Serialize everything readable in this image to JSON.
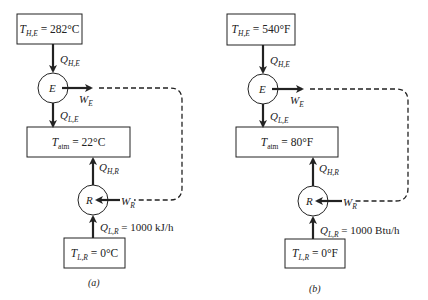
{
  "panels": [
    {
      "caption": "(a)",
      "hot_reservoir": {
        "symbol": "T",
        "sub": "H,E",
        "value": "= 282°C"
      },
      "engine": {
        "label": "E"
      },
      "q_h_e": {
        "symbol": "Q",
        "sub": "H,E"
      },
      "w_e": {
        "symbol": "W",
        "sub": "E"
      },
      "q_l_e": {
        "symbol": "Q",
        "sub": "L,E"
      },
      "atmosphere": {
        "symbol": "T",
        "sub": "atm",
        "value": "= 22°C"
      },
      "q_h_r": {
        "symbol": "Q",
        "sub": "H,R"
      },
      "refrigerator": {
        "label": "R"
      },
      "w_r": {
        "symbol": "W",
        "sub": "R"
      },
      "q_l_r": {
        "symbol": "Q",
        "sub": "L,R",
        "value": "= 1000 kJ/h"
      },
      "cold_reservoir": {
        "symbol": "T",
        "sub": "L,R",
        "value": "= 0°C"
      }
    },
    {
      "caption": "(b)",
      "hot_reservoir": {
        "symbol": "T",
        "sub": "H,E",
        "value": "= 540°F"
      },
      "engine": {
        "label": "E"
      },
      "q_h_e": {
        "symbol": "Q",
        "sub": "H,E"
      },
      "w_e": {
        "symbol": "W",
        "sub": "E"
      },
      "q_l_e": {
        "symbol": "Q",
        "sub": "L,E"
      },
      "atmosphere": {
        "symbol": "T",
        "sub": "atm",
        "value": "= 80°F"
      },
      "q_h_r": {
        "symbol": "Q",
        "sub": "H,R"
      },
      "refrigerator": {
        "label": "R"
      },
      "w_r": {
        "symbol": "W",
        "sub": "R"
      },
      "q_l_r": {
        "symbol": "Q",
        "sub": "L,R",
        "value": "= 1000 Btu/h"
      },
      "cold_reservoir": {
        "symbol": "T",
        "sub": "L,R",
        "value": "= 0°F"
      }
    }
  ],
  "colors": {
    "line": "#222222",
    "background": "#ffffff"
  }
}
